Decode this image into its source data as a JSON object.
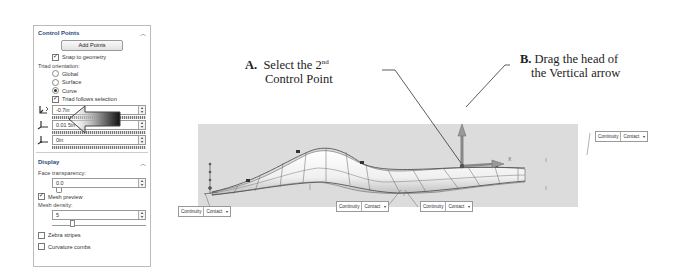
{
  "panel": {
    "control_points": {
      "title": "Control Points",
      "collapse_icon": "chevron-up-icon",
      "add_points_label": "Add Points",
      "snap_to_geometry": {
        "label": "Snap to geometry",
        "checked": true
      },
      "triad_orientation_label": "Triad orientation:",
      "triad_options": [
        {
          "label": "Global",
          "selected": false
        },
        {
          "label": "Surface",
          "selected": false
        },
        {
          "label": "Curve",
          "selected": true
        }
      ],
      "triad_follows_selection": {
        "label": "Triad follows selection",
        "checked": true
      },
      "fields": [
        {
          "icon": "triad-direction-1-icon",
          "value": "-0.7in"
        },
        {
          "icon": "triad-direction-2-icon",
          "value": "0.01 5in"
        },
        {
          "icon": "triad-direction-3-icon",
          "value": "0in"
        }
      ]
    },
    "display": {
      "title": "Display",
      "collapse_icon": "chevron-up-icon",
      "face_transparency_label": "Face transparency:",
      "face_transparency_value": "0.0",
      "mesh_preview": {
        "label": "Mesh preview",
        "checked": true
      },
      "mesh_density_label": "Mesh density:",
      "mesh_density_value": "5",
      "zebra_stripes": {
        "label": "Zebra stripes",
        "checked": false
      },
      "curvature_combs": {
        "label": "Curvature combs",
        "checked": false
      }
    }
  },
  "callouts": {
    "a": {
      "letter": "A.",
      "line1": "Select the 2",
      "sup": "nd",
      "line2": "Control Point"
    },
    "b": {
      "letter": "B.",
      "line1": "Drag the head of",
      "line2": "the Vertical arrow"
    }
  },
  "viewport": {
    "triad_labels": {
      "y": "Y",
      "x": "X"
    },
    "continuity_boxes": [
      {
        "label": "Continuity",
        "value": "Contact"
      },
      {
        "label": "Continuity",
        "value": "Contact"
      },
      {
        "label": "Continuity",
        "value": "Contact"
      },
      {
        "label": "Continuity",
        "value": "Contact"
      }
    ]
  },
  "colors": {
    "panel_title": "#2a4a7a",
    "viewport_bg": "#dcdcdc",
    "callout_text": "#222222"
  }
}
